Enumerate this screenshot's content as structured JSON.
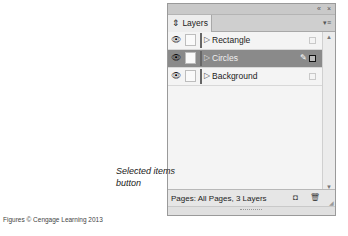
{
  "panel": {
    "title_controls": {
      "collapse": "«",
      "close": "×"
    },
    "tab": {
      "label": "Layers",
      "icon": "double-arrow-icon"
    },
    "menu_icon": "panel-menu-icon",
    "layers": [
      {
        "name": "Rectangle",
        "visible": true,
        "selected": false,
        "color": "#777777"
      },
      {
        "name": "Circles",
        "visible": true,
        "selected": true,
        "color": "#777777"
      },
      {
        "name": "Background",
        "visible": true,
        "selected": false,
        "color": "#777777"
      }
    ],
    "footer": {
      "status": "Pages: All Pages, 3 Layers",
      "new_layer_icon": "new-layer-icon",
      "delete_icon": "trash-icon"
    }
  },
  "annotation": {
    "line1": "Selected items",
    "line2": "button"
  },
  "credit": "Figures © Cengage Learning 2013"
}
